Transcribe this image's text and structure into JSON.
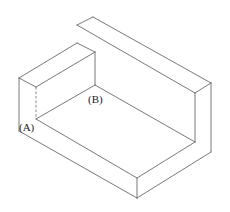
{
  "diagram": {
    "type": "isometric-solid",
    "stroke_color": "#6a6a6a",
    "labels": [
      {
        "id": "A",
        "text": "(A)",
        "x": 19,
        "y": 131,
        "anchor_vertex": [
          36,
          119
        ]
      },
      {
        "id": "B",
        "text": "(B)",
        "x": 88,
        "y": 103,
        "anchor_vertex": [
          95,
          85
        ]
      }
    ],
    "edges": [
      {
        "name": "top-slab-back-left",
        "points": [
          [
            77,
            25
          ],
          [
            93,
            17
          ]
        ]
      },
      {
        "name": "top-slab-back",
        "points": [
          [
            93,
            17
          ],
          [
            211,
            83
          ]
        ]
      },
      {
        "name": "top-slab-left",
        "points": [
          [
            77,
            25
          ],
          [
            195,
            93
          ]
        ]
      },
      {
        "name": "top-slab-right",
        "points": [
          [
            195,
            93
          ],
          [
            211,
            83
          ]
        ]
      },
      {
        "name": "right-wall-inner-vertical",
        "points": [
          [
            195,
            93
          ],
          [
            195,
            142
          ]
        ]
      },
      {
        "name": "right-wall-outer-vertical",
        "points": [
          [
            211,
            83
          ],
          [
            211,
            152
          ]
        ]
      },
      {
        "name": "left-block-top-back",
        "points": [
          [
            19,
            78
          ],
          [
            77,
            43
          ]
        ]
      },
      {
        "name": "left-block-top-right",
        "points": [
          [
            77,
            43
          ],
          [
            95,
            52
          ]
        ]
      },
      {
        "name": "left-block-top-front",
        "points": [
          [
            36,
            87
          ],
          [
            95,
            52
          ]
        ]
      },
      {
        "name": "left-block-top-left",
        "points": [
          [
            19,
            78
          ],
          [
            36,
            87
          ]
        ]
      },
      {
        "name": "left-block-back-vertical",
        "points": [
          [
            95,
            52
          ],
          [
            95,
            85
          ]
        ]
      },
      {
        "name": "left-outer-vertical",
        "points": [
          [
            19,
            78
          ],
          [
            19,
            131
          ]
        ]
      },
      {
        "name": "floor-back-left",
        "points": [
          [
            36,
            119
          ],
          [
            95,
            85
          ]
        ]
      },
      {
        "name": "floor-back-right",
        "points": [
          [
            95,
            85
          ],
          [
            195,
            142
          ]
        ]
      },
      {
        "name": "floor-front-left",
        "points": [
          [
            36,
            119
          ],
          [
            137,
            178
          ]
        ]
      },
      {
        "name": "floor-front-right",
        "points": [
          [
            137,
            178
          ],
          [
            195,
            142
          ]
        ]
      },
      {
        "name": "base-bottom-left",
        "points": [
          [
            19,
            131
          ],
          [
            137,
            198
          ]
        ]
      },
      {
        "name": "base-bottom-right",
        "points": [
          [
            137,
            198
          ],
          [
            211,
            152
          ]
        ]
      },
      {
        "name": "front-corner-vertical",
        "points": [
          [
            137,
            178
          ],
          [
            137,
            198
          ]
        ]
      }
    ],
    "hidden_edges": [
      {
        "name": "hidden-A-vertical",
        "points": [
          [
            36,
            87
          ],
          [
            36,
            119
          ]
        ]
      }
    ]
  }
}
